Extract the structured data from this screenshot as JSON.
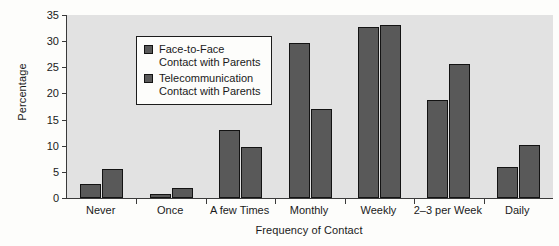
{
  "chart_data": {
    "type": "bar",
    "title": "",
    "xlabel": "Frequency of Contact",
    "ylabel": "Percentage",
    "categories": [
      "Never",
      "Once",
      "A few Times",
      "Monthly",
      "Weekly",
      "2–3 per Week",
      "Daily"
    ],
    "series": [
      {
        "name": "Face-to-Face Contact with Parents",
        "color": "#595959",
        "values": [
          2.6,
          0.8,
          13.0,
          29.6,
          32.8,
          18.8,
          6.0
        ]
      },
      {
        "name": "Telecommunication Contact with Parents",
        "color": "#595959",
        "values": [
          5.5,
          2.0,
          9.7,
          17.1,
          33.0,
          25.7,
          10.2
        ]
      }
    ],
    "ylim": [
      0,
      35
    ],
    "yticks": [
      0,
      5,
      10,
      15,
      20,
      25,
      30,
      35
    ],
    "ytick_labels": [
      "0",
      "5",
      "10",
      "15",
      "20",
      "25",
      "30",
      "35"
    ],
    "grid": false,
    "legend_position": "upper left",
    "plot_background": "#e2e2e2",
    "figure_background": "#fdfdfb",
    "axis_color": "#3a3a3a",
    "bar_edge_color": "#131313"
  },
  "legend": {
    "entries": [
      {
        "line1": "Face-to-Face",
        "line2": "Contact with Parents"
      },
      {
        "line1": "Telecommunication",
        "line2": "Contact with Parents"
      }
    ]
  }
}
